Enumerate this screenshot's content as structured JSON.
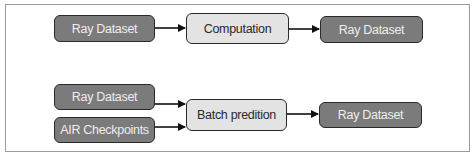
{
  "diagram": {
    "row1": {
      "input": {
        "label": "Ray Dataset"
      },
      "process": {
        "label": "Computation"
      },
      "output": {
        "label": "Ray Dataset"
      }
    },
    "row2": {
      "input1": {
        "label": "Ray Dataset"
      },
      "input2": {
        "label": "AIR Checkpoints"
      },
      "process": {
        "label": "Batch predition"
      },
      "output": {
        "label": "Ray Dataset"
      }
    },
    "colors": {
      "data_node": "#7b7b7b",
      "process_node": "#e3e3e3",
      "border": "#2a2a2a"
    }
  }
}
